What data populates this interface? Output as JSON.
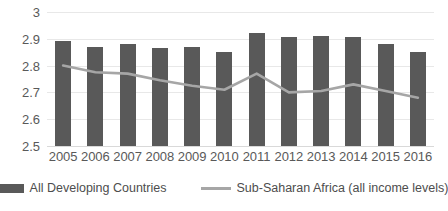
{
  "chart_data": {
    "type": "bar",
    "title": "",
    "subtitle": "",
    "xlabel": "",
    "ylabel": "",
    "categories": [
      "2005",
      "2006",
      "2007",
      "2008",
      "2009",
      "2010",
      "2011",
      "2012",
      "2013",
      "2014",
      "2015",
      "2016"
    ],
    "ylim": [
      2.5,
      3
    ],
    "ytick_labels": [
      "3",
      "2.9",
      "2.8",
      "2.7",
      "2.6",
      "2.5"
    ],
    "ytick_values": [
      3,
      2.9,
      2.8,
      2.7,
      2.6,
      2.5
    ],
    "grid": true,
    "legend_position": "bottom",
    "series": [
      {
        "name": "All Developing Countries",
        "type": "bar",
        "color": "#595959",
        "values": [
          2.89,
          2.87,
          2.88,
          2.865,
          2.87,
          2.85,
          2.92,
          2.905,
          2.91,
          2.905,
          2.88,
          2.85
        ]
      },
      {
        "name": "Sub-Saharan Africa (all income levels)",
        "type": "line",
        "color": "#a6a6a6",
        "values": [
          2.8,
          2.775,
          2.77,
          2.745,
          2.725,
          2.71,
          2.77,
          2.7,
          2.705,
          2.73,
          2.705,
          2.68
        ]
      }
    ]
  },
  "legend": {
    "entries": [
      {
        "label": "All Developing Countries",
        "swatch": "bar-swatch",
        "color": "#595959"
      },
      {
        "label": "Sub-Saharan Africa (all income levels)",
        "swatch": "line-swatch",
        "color": "#a6a6a6"
      }
    ]
  },
  "colors": {
    "bar": "#595959",
    "line": "#a6a6a6",
    "gridline": "#e8e8e8",
    "text": "#595959",
    "background": "#ffffff"
  }
}
